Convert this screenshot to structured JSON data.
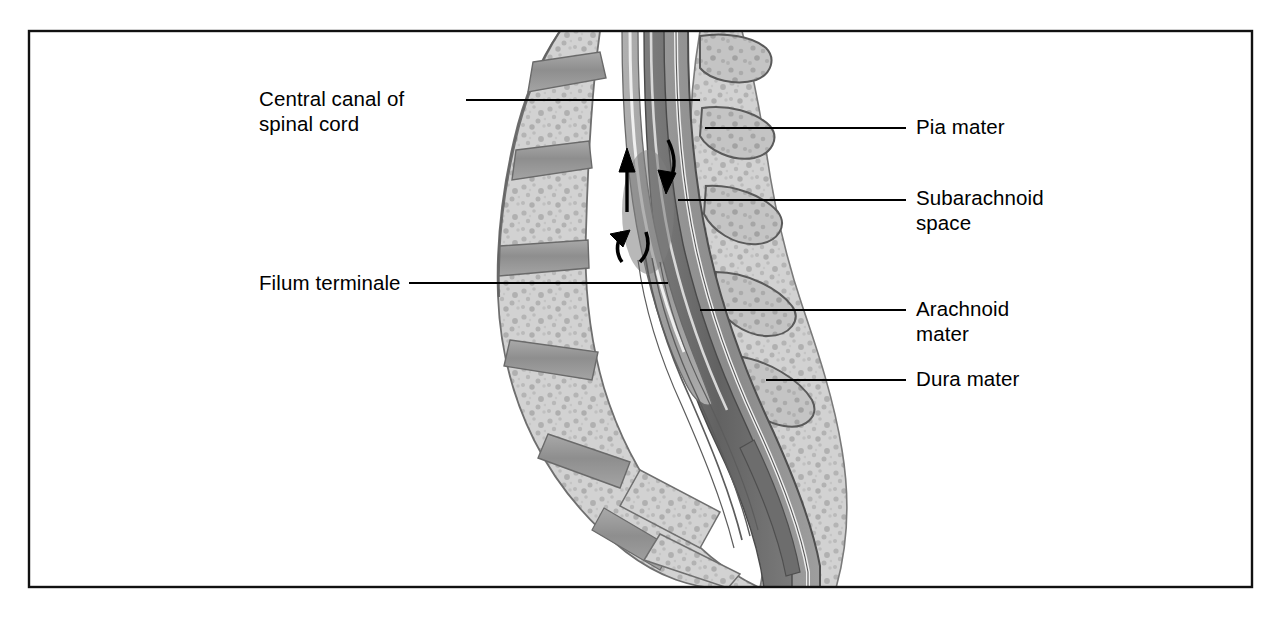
{
  "figure": {
    "frame": {
      "x": 28,
      "y": 30,
      "width": 1225,
      "height": 558,
      "border_color": "#111111",
      "border_width": 2
    },
    "background_color": "#ffffff",
    "palette": {
      "bone_light": "#cfcfcf",
      "bone_mid": "#bdbdbd",
      "bone_outline": "#6f6f6f",
      "disc_gray": "#9a9a9a",
      "dura_gray": "#8d8d8d",
      "subarachnoid_dark": "#6a6a6a",
      "cord_gray": "#a8a8a8",
      "canal_light": "#e8e8e8",
      "line_black": "#000000"
    }
  },
  "labels": [
    {
      "id": "central-canal",
      "text": "Central canal of\nspinal cord",
      "side": "left",
      "x": 259,
      "y": 86,
      "leader": {
        "x1": 466,
        "y1": 100,
        "x2": 700,
        "y2": 100
      }
    },
    {
      "id": "filum-terminale",
      "text": "Filum terminale",
      "side": "left",
      "x": 259,
      "y": 270,
      "leader": {
        "x1": 409,
        "y1": 283,
        "x2": 668,
        "y2": 283
      }
    },
    {
      "id": "pia-mater",
      "text": "Pia mater",
      "side": "right",
      "x": 916,
      "y": 114,
      "leader": {
        "x1": 705,
        "y1": 128,
        "x2": 906,
        "y2": 128
      }
    },
    {
      "id": "subarachnoid-space",
      "text": "Subarachnoid\nspace",
      "side": "right",
      "x": 916,
      "y": 185,
      "leader": {
        "x1": 678,
        "y1": 200,
        "x2": 906,
        "y2": 200
      }
    },
    {
      "id": "arachnoid-mater",
      "text": "Arachnoid\nmater",
      "side": "right",
      "x": 916,
      "y": 296,
      "leader": {
        "x1": 700,
        "y1": 310,
        "x2": 906,
        "y2": 310
      }
    },
    {
      "id": "dura-mater",
      "text": "Dura mater",
      "side": "right",
      "x": 916,
      "y": 366,
      "leader": {
        "x1": 766,
        "y1": 380,
        "x2": 906,
        "y2": 380
      }
    }
  ],
  "flow_arrows": [
    {
      "id": "csf-ascending-arrow",
      "direction": "up",
      "x": 625,
      "y": 175
    },
    {
      "id": "csf-descending-arrow",
      "direction": "down-right",
      "x": 672,
      "y": 165
    },
    {
      "id": "csf-caudal-arrow-left",
      "direction": "down",
      "x": 616,
      "y": 245
    },
    {
      "id": "csf-caudal-arrow-right",
      "direction": "down",
      "x": 639,
      "y": 245
    }
  ],
  "structures": [
    {
      "id": "vertebral-bodies",
      "name": "Lumbar vertebral bodies"
    },
    {
      "id": "intervertebral-discs",
      "name": "Intervertebral discs"
    },
    {
      "id": "spinous-processes",
      "name": "Spinous processes"
    },
    {
      "id": "sacrum",
      "name": "Sacrum"
    },
    {
      "id": "vertebral-canal",
      "name": "Vertebral canal"
    },
    {
      "id": "spinal-cord",
      "name": "Spinal cord"
    },
    {
      "id": "dura-mater-layer",
      "name": "Dura mater layer"
    },
    {
      "id": "arachnoid-layer",
      "name": "Arachnoid mater layer"
    },
    {
      "id": "pia-layer",
      "name": "Pia mater layer"
    },
    {
      "id": "cauda-equina",
      "name": "Cauda equina / filum terminale"
    }
  ]
}
